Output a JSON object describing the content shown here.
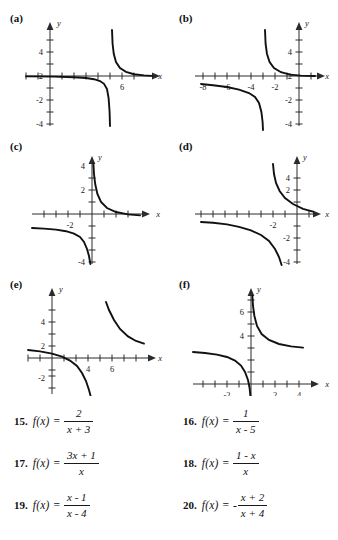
{
  "graphs": [
    {
      "label": "(a)",
      "x_axis_label": "x",
      "y_axis_label": "y",
      "x_ticks_labeled": [
        {
          "value": 6,
          "text": "6"
        }
      ],
      "y_ticks_labeled": [
        {
          "value": 4,
          "text": "4"
        },
        {
          "value": 2,
          "text": "2"
        },
        {
          "value": -2,
          "text": "-2"
        },
        {
          "value": -4,
          "text": "-4"
        }
      ],
      "vertical_asymptote": 5,
      "horizontal_asymptote": 0,
      "function_described": "1/(x-5)",
      "x_range": [
        -2,
        9
      ],
      "y_range": [
        -5,
        5
      ]
    },
    {
      "label": "(b)",
      "x_axis_label": "x",
      "y_axis_label": "y",
      "x_ticks_labeled": [
        {
          "value": -8,
          "text": "-8"
        },
        {
          "value": -6,
          "text": "-6"
        },
        {
          "value": -4,
          "text": "-4"
        },
        {
          "value": -2,
          "text": "-2"
        }
      ],
      "y_ticks_labeled": [
        {
          "value": 4,
          "text": "4"
        },
        {
          "value": 2,
          "text": "2"
        },
        {
          "value": -2,
          "text": "-2"
        },
        {
          "value": -4,
          "text": "-4"
        }
      ],
      "vertical_asymptote": -3,
      "horizontal_asymptote": 0,
      "function_described": "2/(x+3)",
      "x_range": [
        -9.5,
        2
      ],
      "y_range": [
        -5,
        5
      ]
    },
    {
      "label": "(c)",
      "x_axis_label": "x",
      "y_axis_label": "y",
      "x_ticks_labeled": [
        {
          "value": -2,
          "text": "-2"
        }
      ],
      "y_ticks_labeled": [
        {
          "value": 4,
          "text": "4"
        },
        {
          "value": 2,
          "text": "2"
        },
        {
          "value": -4,
          "text": "-4"
        }
      ],
      "vertical_asymptote": 0,
      "horizontal_asymptote": -1,
      "function_described": "(1-x)/x",
      "x_range": [
        -5.5,
        5.5
      ],
      "y_range": [
        -5,
        5
      ]
    },
    {
      "label": "(d)",
      "x_axis_label": "x",
      "y_axis_label": "y",
      "x_ticks_labeled": [
        {
          "value": -2,
          "text": "-2"
        }
      ],
      "y_ticks_labeled": [
        {
          "value": 4,
          "text": "4"
        },
        {
          "value": 2,
          "text": "2"
        },
        {
          "value": -2,
          "text": "-2"
        },
        {
          "value": -4,
          "text": "-4"
        }
      ],
      "vertical_asymptote": -1,
      "horizontal_asymptote": 0,
      "function_described": "1/(x+1)",
      "x_range": [
        -6.5,
        2.5
      ],
      "y_range": [
        -5,
        5
      ]
    },
    {
      "label": "(e)",
      "x_axis_label": "x",
      "y_axis_label": "y",
      "x_ticks_labeled": [
        {
          "value": 4,
          "text": "4"
        },
        {
          "value": 6,
          "text": "6"
        }
      ],
      "y_ticks_labeled": [
        {
          "value": 4,
          "text": "4"
        },
        {
          "value": 2,
          "text": "2"
        },
        {
          "value": -2,
          "text": "-2"
        }
      ],
      "vertical_asymptote": 4,
      "horizontal_asymptote": 1,
      "function_described": "(x-1)/(x-4)",
      "x_range": [
        -1.5,
        8
      ],
      "y_range": [
        -3.5,
        6
      ]
    },
    {
      "label": "(f)",
      "x_axis_label": "x",
      "y_axis_label": "y",
      "x_ticks_labeled": [
        {
          "value": -2,
          "text": "-2"
        },
        {
          "value": 2,
          "text": "2"
        },
        {
          "value": 4,
          "text": "4"
        }
      ],
      "y_ticks_labeled": [
        {
          "value": 6,
          "text": "6"
        },
        {
          "value": 4,
          "text": "4"
        }
      ],
      "vertical_asymptote": 0,
      "horizontal_asymptote": 3,
      "function_described": "(3x+1)/x",
      "x_range": [
        -4,
        5
      ],
      "y_range": [
        -1.5,
        8.5
      ]
    }
  ],
  "exercises": {
    "left_column": [
      {
        "number": "15.",
        "fx": "f(x)",
        "equals": "=",
        "sign": "",
        "numerator": "2",
        "denominator": "x + 3"
      },
      {
        "number": "17.",
        "fx": "f(x)",
        "equals": "=",
        "sign": "",
        "numerator": "3x + 1",
        "denominator": "x"
      },
      {
        "number": "19.",
        "fx": "f(x)",
        "equals": "=",
        "sign": "",
        "numerator": "x - 1",
        "denominator": "x - 4"
      }
    ],
    "right_column": [
      {
        "number": "16.",
        "fx": "f(x)",
        "equals": "=",
        "sign": "",
        "numerator": "1",
        "denominator": "x - 5"
      },
      {
        "number": "18.",
        "fx": "f(x)",
        "equals": "=",
        "sign": "",
        "numerator": "1 - x",
        "denominator": "x"
      },
      {
        "number": "20.",
        "fx": "f(x)",
        "equals": "=",
        "sign": "-",
        "numerator": "x + 2",
        "denominator": "x + 4"
      }
    ]
  }
}
